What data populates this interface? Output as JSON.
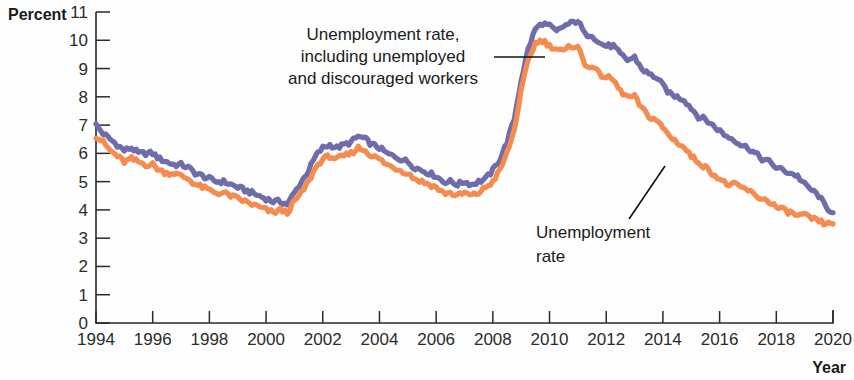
{
  "chart_data": {
    "type": "line",
    "title": "",
    "xlabel": "Year",
    "ylabel": "Percent",
    "xlim": [
      1994,
      2020
    ],
    "ylim": [
      0,
      11
    ],
    "grid": false,
    "legend_position": "annotations-inline",
    "x_ticks": [
      "1994",
      "1996",
      "1998",
      "2000",
      "2002",
      "2004",
      "2006",
      "2008",
      "2010",
      "2012",
      "2014",
      "2016",
      "2018",
      "2020"
    ],
    "y_ticks": [
      "0",
      "1",
      "2",
      "3",
      "4",
      "5",
      "6",
      "7",
      "8",
      "9",
      "10",
      "11"
    ],
    "annotations": [
      {
        "id": "annotation-broad-rate",
        "lines": [
          "Unemployment rate,",
          "including unemployed",
          "and discouraged workers"
        ],
        "points_to_series": "Unemployment rate, including unemployed and discouraged workers"
      },
      {
        "id": "annotation-headline-rate",
        "lines": [
          "Unemployment",
          "rate"
        ],
        "points_to_series": "Unemployment rate"
      }
    ],
    "colors": {
      "broad_rate": "#6f6cab",
      "headline_rate": "#f58b4f",
      "axis": "#2a2a2a",
      "text": "#1a1a1a"
    },
    "series": [
      {
        "name": "Unemployment rate, including unemployed and discouraged workers",
        "color": "#6f6cab",
        "x": [
          1994.0,
          1994.25,
          1994.5,
          1994.75,
          1995.0,
          1995.25,
          1995.5,
          1995.75,
          1996.0,
          1996.25,
          1996.5,
          1996.75,
          1997.0,
          1997.25,
          1997.5,
          1997.75,
          1998.0,
          1998.25,
          1998.5,
          1998.75,
          1999.0,
          1999.25,
          1999.5,
          1999.75,
          2000.0,
          2000.25,
          2000.5,
          2000.75,
          2001.0,
          2001.25,
          2001.5,
          2001.75,
          2002.0,
          2002.25,
          2002.5,
          2002.75,
          2003.0,
          2003.25,
          2003.5,
          2003.75,
          2004.0,
          2004.25,
          2004.5,
          2004.75,
          2005.0,
          2005.25,
          2005.5,
          2005.75,
          2006.0,
          2006.25,
          2006.5,
          2006.75,
          2007.0,
          2007.25,
          2007.5,
          2007.75,
          2008.0,
          2008.25,
          2008.5,
          2008.75,
          2009.0,
          2009.25,
          2009.5,
          2009.75,
          2010.0,
          2010.25,
          2010.5,
          2010.75,
          2011.0,
          2011.25,
          2011.5,
          2011.75,
          2012.0,
          2012.25,
          2012.5,
          2012.75,
          2013.0,
          2013.25,
          2013.5,
          2013.75,
          2014.0,
          2014.25,
          2014.5,
          2014.75,
          2015.0,
          2015.25,
          2015.5,
          2015.75,
          2016.0,
          2016.25,
          2016.5,
          2016.75,
          2017.0,
          2017.25,
          2017.5,
          2017.75,
          2018.0,
          2018.25,
          2018.5,
          2018.75,
          2019.0,
          2019.25,
          2019.5,
          2019.75,
          2020.0
        ],
        "values": [
          7.0,
          6.7,
          6.5,
          6.3,
          6.1,
          6.2,
          6.0,
          6.0,
          6.0,
          5.8,
          5.7,
          5.6,
          5.6,
          5.5,
          5.3,
          5.2,
          5.1,
          5.0,
          5.0,
          4.9,
          4.8,
          4.7,
          4.6,
          4.5,
          4.4,
          4.3,
          4.3,
          4.2,
          4.6,
          5.0,
          5.4,
          5.9,
          6.2,
          6.3,
          6.2,
          6.3,
          6.4,
          6.6,
          6.5,
          6.3,
          6.2,
          6.0,
          5.9,
          5.8,
          5.7,
          5.5,
          5.4,
          5.3,
          5.2,
          5.0,
          5.0,
          4.9,
          5.0,
          4.9,
          5.0,
          5.1,
          5.4,
          5.8,
          6.4,
          7.2,
          8.6,
          9.7,
          10.4,
          10.6,
          10.5,
          10.3,
          10.5,
          10.6,
          10.7,
          10.2,
          10.2,
          9.9,
          9.8,
          9.8,
          9.5,
          9.3,
          9.4,
          9.0,
          8.8,
          8.7,
          8.4,
          8.1,
          8.0,
          7.9,
          7.6,
          7.3,
          7.2,
          7.0,
          6.8,
          6.6,
          6.5,
          6.3,
          6.2,
          6.0,
          5.8,
          5.7,
          5.5,
          5.4,
          5.3,
          5.2,
          4.9,
          4.7,
          4.5,
          4.1,
          3.9
        ]
      },
      {
        "name": "Unemployment rate",
        "color": "#f58b4f",
        "x": [
          1994.0,
          1994.25,
          1994.5,
          1994.75,
          1995.0,
          1995.25,
          1995.5,
          1995.75,
          1996.0,
          1996.25,
          1996.5,
          1996.75,
          1997.0,
          1997.25,
          1997.5,
          1997.75,
          1998.0,
          1998.25,
          1998.5,
          1998.75,
          1999.0,
          1999.25,
          1999.5,
          1999.75,
          2000.0,
          2000.25,
          2000.5,
          2000.75,
          2001.0,
          2001.25,
          2001.5,
          2001.75,
          2002.0,
          2002.25,
          2002.5,
          2002.75,
          2003.0,
          2003.25,
          2003.5,
          2003.75,
          2004.0,
          2004.25,
          2004.5,
          2004.75,
          2005.0,
          2005.25,
          2005.5,
          2005.75,
          2006.0,
          2006.25,
          2006.5,
          2006.75,
          2007.0,
          2007.25,
          2007.5,
          2007.75,
          2008.0,
          2008.25,
          2008.5,
          2008.75,
          2009.0,
          2009.25,
          2009.5,
          2009.75,
          2010.0,
          2010.25,
          2010.5,
          2010.75,
          2011.0,
          2011.25,
          2011.5,
          2011.75,
          2012.0,
          2012.25,
          2012.5,
          2012.75,
          2013.0,
          2013.25,
          2013.5,
          2013.75,
          2014.0,
          2014.25,
          2014.5,
          2014.75,
          2015.0,
          2015.25,
          2015.5,
          2015.75,
          2016.0,
          2016.25,
          2016.5,
          2016.75,
          2017.0,
          2017.25,
          2017.5,
          2017.75,
          2018.0,
          2018.25,
          2018.5,
          2018.75,
          2019.0,
          2019.25,
          2019.5,
          2019.75,
          2020.0
        ],
        "values": [
          6.6,
          6.4,
          6.1,
          5.9,
          5.7,
          5.8,
          5.7,
          5.6,
          5.6,
          5.4,
          5.3,
          5.3,
          5.2,
          5.1,
          4.9,
          4.8,
          4.7,
          4.6,
          4.6,
          4.5,
          4.4,
          4.3,
          4.2,
          4.1,
          4.0,
          3.9,
          4.0,
          3.9,
          4.3,
          4.6,
          5.0,
          5.5,
          5.8,
          5.9,
          5.8,
          5.9,
          6.0,
          6.2,
          6.1,
          5.9,
          5.8,
          5.6,
          5.5,
          5.4,
          5.3,
          5.1,
          5.0,
          4.9,
          4.8,
          4.6,
          4.6,
          4.5,
          4.6,
          4.5,
          4.6,
          4.8,
          5.0,
          5.4,
          6.0,
          6.8,
          8.2,
          9.3,
          9.9,
          10.0,
          9.8,
          9.7,
          9.6,
          9.8,
          9.8,
          9.1,
          9.1,
          8.8,
          8.7,
          8.6,
          8.2,
          8.0,
          8.0,
          7.6,
          7.3,
          7.2,
          6.9,
          6.6,
          6.4,
          6.2,
          5.9,
          5.7,
          5.5,
          5.3,
          5.1,
          4.9,
          4.9,
          4.8,
          4.7,
          4.5,
          4.4,
          4.3,
          4.1,
          4.0,
          3.9,
          3.8,
          3.8,
          3.7,
          3.6,
          3.5,
          3.5
        ]
      }
    ]
  }
}
